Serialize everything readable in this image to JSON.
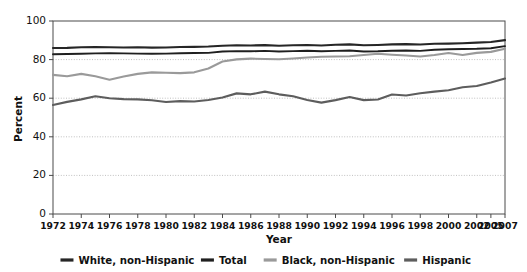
{
  "chart_data": {
    "type": "line",
    "title": "",
    "xlabel": "Year",
    "ylabel": "Percent",
    "ylim": [
      0,
      100
    ],
    "yticks": [
      0,
      20,
      40,
      60,
      80,
      100
    ],
    "grid": "horizontal-dotted",
    "legend_position": "bottom",
    "x": [
      1972,
      1973,
      1974,
      1975,
      1976,
      1977,
      1978,
      1979,
      1980,
      1981,
      1982,
      1983,
      1984,
      1985,
      1986,
      1987,
      1988,
      1989,
      1990,
      1991,
      1992,
      1993,
      1994,
      1995,
      1996,
      1997,
      1998,
      1999,
      2000,
      2001,
      2002,
      2005,
      2007
    ],
    "xtick_labels": [
      "1972",
      "1974",
      "1976",
      "1978",
      "1980",
      "1982",
      "1984",
      "1986",
      "1988",
      "1990",
      "1992",
      "1994",
      "1996",
      "1998",
      "2000",
      "2002",
      "2005",
      "2007"
    ],
    "xtick_values": [
      1972,
      1974,
      1976,
      1978,
      1980,
      1982,
      1984,
      1986,
      1988,
      1990,
      1992,
      1994,
      1996,
      1998,
      2000,
      2002,
      2005,
      2007
    ],
    "series": [
      {
        "name": "White, non-Hispanic",
        "color": "#262626",
        "width": 2.1,
        "values": [
          86.0,
          86.1,
          86.4,
          86.5,
          86.4,
          86.3,
          86.4,
          86.2,
          86.3,
          86.5,
          86.6,
          86.8,
          87.2,
          87.4,
          87.3,
          87.5,
          87.2,
          87.4,
          87.6,
          87.3,
          87.7,
          87.9,
          87.4,
          87.6,
          87.9,
          88.0,
          87.8,
          88.2,
          88.3,
          88.5,
          88.8,
          89.1,
          90.1
        ]
      },
      {
        "name": "Total",
        "color": "#1f1f1f",
        "width": 1.9,
        "values": [
          82.8,
          82.9,
          83.0,
          83.2,
          83.3,
          83.2,
          83.1,
          83.0,
          83.1,
          83.3,
          83.4,
          83.5,
          84.2,
          84.4,
          84.3,
          84.5,
          84.2,
          84.4,
          84.6,
          84.3,
          84.5,
          84.7,
          84.2,
          84.3,
          84.6,
          84.7,
          84.5,
          85.1,
          85.4,
          85.5,
          85.6,
          85.9,
          87.0
        ]
      },
      {
        "name": "Black, non-Hispanic",
        "color": "#9a9a9a",
        "width": 2.1,
        "values": [
          72.1,
          71.4,
          72.6,
          71.4,
          69.6,
          71.2,
          72.6,
          73.4,
          73.2,
          73.0,
          73.4,
          75.4,
          79.0,
          80.1,
          80.5,
          80.3,
          80.2,
          80.6,
          81.1,
          81.5,
          81.6,
          81.7,
          82.4,
          83.0,
          82.5,
          82.1,
          81.6,
          82.4,
          83.4,
          82.4,
          83.5,
          84.0,
          85.6
        ]
      },
      {
        "name": "Hispanic",
        "color": "#5d5d5d",
        "width": 2.1,
        "values": [
          56.5,
          58.1,
          59.4,
          61.0,
          60.0,
          59.5,
          59.4,
          58.9,
          58.0,
          58.5,
          58.3,
          59.1,
          60.4,
          62.5,
          62.0,
          63.4,
          62.0,
          61.0,
          59.1,
          57.7,
          59.0,
          60.6,
          59.0,
          59.3,
          61.9,
          61.4,
          62.6,
          63.4,
          64.1,
          65.7,
          66.3,
          68.1,
          70.2
        ]
      }
    ]
  },
  "axes": {
    "y_label": "Percent",
    "x_label": "Year",
    "y_tick_labels": [
      "0",
      "20",
      "40",
      "60",
      "80",
      "100"
    ]
  },
  "legend": {
    "items": [
      {
        "label": "White, non-Hispanic",
        "color": "#262626"
      },
      {
        "label": "Total",
        "color": "#1f1f1f"
      },
      {
        "label": "Black, non-Hispanic",
        "color": "#9a9a9a"
      },
      {
        "label": "Hispanic",
        "color": "#5d5d5d"
      }
    ]
  },
  "style": {
    "axis_color": "#4a4a4a",
    "grid_color": "#b0b0b0",
    "background": "#ffffff"
  }
}
